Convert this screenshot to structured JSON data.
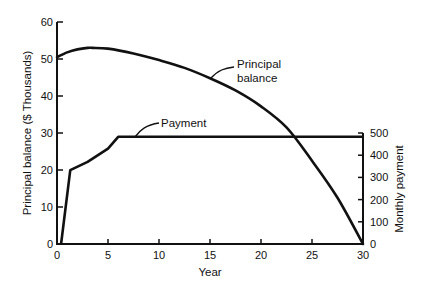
{
  "chart_data": {
    "type": "line",
    "title": "",
    "xlabel": "Year",
    "ylabel": "Principal balance ($ Thousands)",
    "y2label": "Monthly payment",
    "xlim": [
      0,
      30
    ],
    "ylim": [
      0,
      60
    ],
    "y2lim": [
      0,
      500
    ],
    "x_ticks": [
      0,
      5,
      10,
      15,
      20,
      25,
      30
    ],
    "y_ticks": [
      0,
      10,
      20,
      30,
      40,
      50,
      60
    ],
    "y2_ticks": [
      0,
      100,
      200,
      300,
      400,
      500
    ],
    "grid": false,
    "legend": "none (inline annotations)",
    "series": [
      {
        "name": "Principal balance",
        "axis": "left",
        "x": [
          0,
          1,
          2,
          3,
          3.5,
          5,
          7.5,
          10,
          12.5,
          15,
          17.5,
          20,
          22.5,
          25,
          27.5,
          30
        ],
        "values": [
          50.5,
          51.8,
          52.6,
          53,
          53,
          52.8,
          51.5,
          49.7,
          47.6,
          44.8,
          41.5,
          37.2,
          31.5,
          22.5,
          12.5,
          0
        ]
      },
      {
        "name": "Payment",
        "axis": "right",
        "x": [
          0.4,
          1.3,
          3,
          5,
          6,
          10,
          15,
          20,
          25,
          30
        ],
        "values": [
          0,
          333,
          370,
          430,
          483,
          483,
          483,
          483,
          483,
          483
        ]
      }
    ],
    "annotations": [
      {
        "text": "Principal balance",
        "target": "Principal balance curve near year 15"
      },
      {
        "text": "Payment",
        "target": "Payment line near year 8"
      }
    ]
  },
  "labels": {
    "xlabel": "Year",
    "ylabel": "Principal balance ($ Thousands)",
    "y2label": "Monthly payment",
    "annot_principal_1": "Principal",
    "annot_principal_2": "balance",
    "annot_payment": "Payment",
    "x_ticks": [
      "0",
      "5",
      "10",
      "15",
      "20",
      "25",
      "30"
    ],
    "y_ticks": [
      "0",
      "10",
      "20",
      "30",
      "40",
      "50",
      "60"
    ],
    "y2_ticks": [
      "0",
      "100",
      "200",
      "300",
      "400",
      "500"
    ]
  }
}
